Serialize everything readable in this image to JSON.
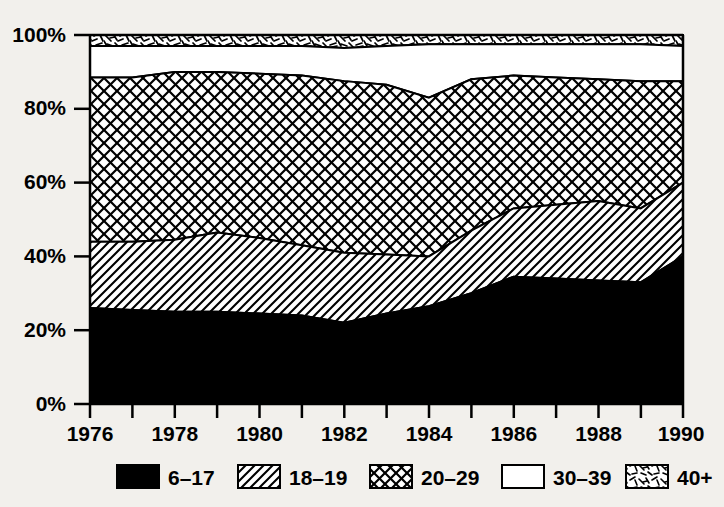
{
  "chart_data": {
    "type": "area",
    "stacked": true,
    "normalized_percent": true,
    "title": "",
    "subtitle": "",
    "xlabel": "",
    "ylabel": "",
    "grid": false,
    "legend_position": "bottom",
    "xlim": [
      1976,
      1990
    ],
    "ylim": [
      0,
      100
    ],
    "x": [
      1976,
      1977,
      1978,
      1979,
      1980,
      1981,
      1982,
      1983,
      1984,
      1985,
      1986,
      1987,
      1988,
      1989,
      1990
    ],
    "x_tick_labels": [
      "1976",
      "1978",
      "1980",
      "1982",
      "1984",
      "1986",
      "1988",
      "1990"
    ],
    "x_tick_values": [
      1976,
      1978,
      1980,
      1982,
      1984,
      1986,
      1988,
      1990
    ],
    "x_minor_ticks": [
      1976,
      1977,
      1978,
      1979,
      1980,
      1981,
      1982,
      1983,
      1984,
      1985,
      1986,
      1987,
      1988,
      1989,
      1990
    ],
    "y_tick_labels": [
      "0%",
      "20%",
      "40%",
      "60%",
      "80%",
      "100%"
    ],
    "y_tick_values": [
      0,
      20,
      40,
      60,
      80,
      100
    ],
    "series": [
      {
        "name": "6–17",
        "pattern": "solid-black",
        "values": [
          26.0,
          25.5,
          25.0,
          25.0,
          24.5,
          24.0,
          22.0,
          24.5,
          26.5,
          30.0,
          34.5,
          34.0,
          33.5,
          33.0,
          40.0
        ]
      },
      {
        "name": "18–19",
        "pattern": "diagonal-hatch",
        "values": [
          18.0,
          18.5,
          19.5,
          21.5,
          20.5,
          19.0,
          19.0,
          16.0,
          13.5,
          17.0,
          18.5,
          20.0,
          21.5,
          20.0,
          20.0
        ]
      },
      {
        "name": "20–29",
        "pattern": "cross-hatch",
        "values": [
          44.5,
          44.5,
          45.5,
          43.5,
          44.5,
          46.0,
          46.5,
          46.0,
          43.0,
          41.0,
          36.0,
          34.5,
          33.0,
          34.5,
          27.5
        ]
      },
      {
        "name": "30–39",
        "pattern": "white-empty",
        "values": [
          8.5,
          8.5,
          7.0,
          7.0,
          7.5,
          8.0,
          9.0,
          10.5,
          14.5,
          9.5,
          8.5,
          9.0,
          9.5,
          10.0,
          9.5
        ]
      },
      {
        "name": "40+",
        "pattern": "scribble",
        "values": [
          3.0,
          3.0,
          3.0,
          3.0,
          3.0,
          3.0,
          3.5,
          3.0,
          2.5,
          2.5,
          2.5,
          2.5,
          2.5,
          2.5,
          3.0
        ]
      }
    ],
    "cumulative_tops": {
      "6–17": [
        26.0,
        25.5,
        25.0,
        25.0,
        24.5,
        24.0,
        22.0,
        24.5,
        26.5,
        30.0,
        34.5,
        34.0,
        33.5,
        33.0,
        40.0
      ],
      "18–19": [
        44.0,
        44.0,
        44.5,
        46.5,
        45.0,
        43.0,
        41.0,
        40.5,
        40.0,
        47.0,
        53.0,
        54.0,
        55.0,
        53.0,
        60.0
      ],
      "20–29": [
        88.5,
        88.5,
        90.0,
        90.0,
        89.5,
        89.0,
        87.5,
        86.5,
        83.0,
        88.0,
        89.0,
        88.5,
        88.0,
        87.5,
        87.5
      ],
      "30–39": [
        97.0,
        97.0,
        97.0,
        97.0,
        97.0,
        97.0,
        96.5,
        97.0,
        97.5,
        97.5,
        97.5,
        97.5,
        97.5,
        97.5,
        97.0
      ],
      "40+": [
        100,
        100,
        100,
        100,
        100,
        100,
        100,
        100,
        100,
        100,
        100,
        100,
        100,
        100,
        100
      ]
    }
  },
  "legend": {
    "items": [
      {
        "label": "6–17",
        "pattern": "solid-black"
      },
      {
        "label": "18–19",
        "pattern": "diagonal-hatch"
      },
      {
        "label": "20–29",
        "pattern": "cross-hatch"
      },
      {
        "label": "30–39",
        "pattern": "white-empty"
      },
      {
        "label": "40+",
        "pattern": "scribble"
      }
    ]
  },
  "colors": {
    "background": "#f2f0ec",
    "ink": "#000000",
    "fill_white": "#ffffff"
  }
}
